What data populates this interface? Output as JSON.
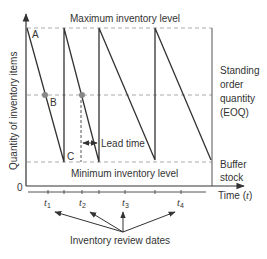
{
  "diagram": {
    "labels": {
      "max_level": "Maximum inventory level",
      "min_level": "Minimum inventory level",
      "y_axis": "Quantity of inventory items",
      "x_axis": "Time (t)",
      "origin": "0",
      "point_a": "A",
      "point_b": "B",
      "point_c": "C",
      "lead_time": "Lead time",
      "standing_order_line1": "Standing",
      "standing_order_line2": "order",
      "standing_order_line3": "quantity",
      "standing_order_line4": "(EOQ)",
      "buffer_line1": "Buffer",
      "buffer_line2": "stock",
      "review_dates": "Inventory review dates",
      "x_axis_prefix": "Time (",
      "x_axis_var": "t",
      "x_axis_suffix": ")"
    },
    "review_ticks": [
      {
        "label": "t",
        "sub": "1"
      },
      {
        "label": "t",
        "sub": "2"
      },
      {
        "label": "t",
        "sub": "3"
      },
      {
        "label": "t",
        "sub": "4"
      }
    ],
    "colors": {
      "line": "#333333",
      "dashed": "#aaaaaa",
      "marker": "#888888"
    }
  }
}
